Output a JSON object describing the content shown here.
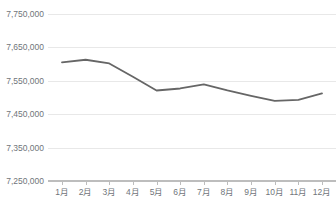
{
  "chart_data": {
    "type": "line",
    "title": "",
    "xlabel": "",
    "ylabel": "",
    "categories": [
      "1月",
      "2月",
      "3月",
      "4月",
      "5月",
      "6月",
      "7月",
      "8月",
      "9月",
      "10月",
      "11月",
      "12月"
    ],
    "series": [
      {
        "name": "",
        "color": "#666666",
        "values": [
          7605000,
          7613000,
          7602000,
          7562000,
          7521000,
          7527000,
          7539000,
          7521000,
          7505000,
          7490000,
          7493000,
          7512000
        ]
      }
    ],
    "ylim": [
      7250000,
      7750000
    ],
    "ytick_values": [
      7750000,
      7650000,
      7550000,
      7450000,
      7350000,
      7250000
    ],
    "ytick_labels": [
      "7,750,000",
      "7,650,000",
      "7,550,000",
      "7,450,000",
      "7,350,000",
      "7,250,000"
    ],
    "grid": true,
    "legend": "none",
    "gridline_color": "#e8e8e8",
    "axis_color": "#bdbdbd",
    "tick_label_color": "#70757a",
    "background": "#ffffff"
  },
  "header": {
    "clipped_title": ""
  }
}
